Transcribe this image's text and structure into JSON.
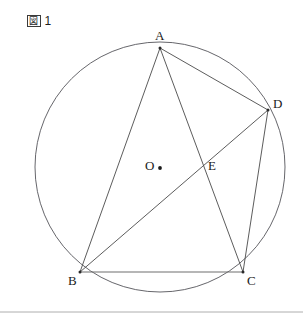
{
  "caption": {
    "kanji": "図",
    "number": "1",
    "full": "図 1"
  },
  "figure": {
    "type": "circle-geometry-diagram",
    "stroke_color": "#4a4a4a",
    "circle_color": "#55555a",
    "base_color": "#6e6e6e",
    "label_color": "#1a1a1a",
    "background": "#ffffff",
    "circle": {
      "label": "O",
      "center_x": 160,
      "center_y": 167,
      "radius": 125
    },
    "points": [
      {
        "name": "A",
        "label": "A",
        "x": 160,
        "y": 48,
        "label_x": 155,
        "label_y": 40,
        "show_dot": true
      },
      {
        "name": "B",
        "label": "B",
        "x": 80,
        "y": 272,
        "label_x": 68,
        "label_y": 285,
        "show_dot": true
      },
      {
        "name": "C",
        "label": "C",
        "x": 243,
        "y": 272,
        "label_x": 247,
        "label_y": 285,
        "show_dot": true
      },
      {
        "name": "D",
        "label": "D",
        "x": 268,
        "y": 110,
        "label_x": 273,
        "label_y": 108,
        "show_dot": true
      },
      {
        "name": "E",
        "label": "E",
        "x": 203,
        "y": 162,
        "label_x": 208,
        "label_y": 170,
        "show_dot": false
      },
      {
        "name": "O",
        "label": "O",
        "x": 160,
        "y": 168,
        "label_x": 145,
        "label_y": 170,
        "show_dot": true
      }
    ],
    "segments": [
      {
        "name": "AB",
        "from": "A",
        "to": "B",
        "style": "chord"
      },
      {
        "name": "AC",
        "from": "A",
        "to": "C",
        "style": "chord"
      },
      {
        "name": "AD",
        "from": "A",
        "to": "D",
        "style": "chord"
      },
      {
        "name": "BD",
        "from": "B",
        "to": "D",
        "style": "chord"
      },
      {
        "name": "CD",
        "from": "C",
        "to": "D",
        "style": "chord"
      },
      {
        "name": "BC",
        "from": "B",
        "to": "C",
        "style": "base"
      }
    ],
    "intersections": [
      {
        "name": "E",
        "of": [
          "AC",
          "BD"
        ]
      }
    ]
  },
  "footer": {
    "rule_y": 312
  }
}
